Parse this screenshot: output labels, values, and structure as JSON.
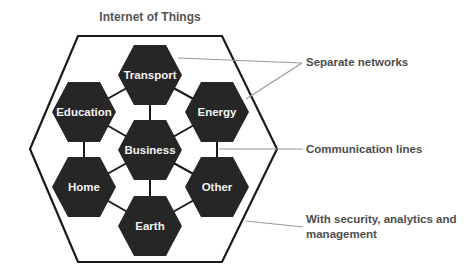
{
  "title": "Internet of Things",
  "colors": {
    "hex_fill": "#262626",
    "hex_text": "#f2f2f2",
    "outer_stroke": "#1a1a1a",
    "connector": "#1a1a1a",
    "leader": "#9a9a9a",
    "label_text": "#4d4d4d"
  },
  "center_node": {
    "label": "Business"
  },
  "nodes": [
    {
      "id": "transport",
      "label": "Transport"
    },
    {
      "id": "energy",
      "label": "Energy"
    },
    {
      "id": "other",
      "label": "Other"
    },
    {
      "id": "earth",
      "label": "Earth"
    },
    {
      "id": "home",
      "label": "Home"
    },
    {
      "id": "education",
      "label": "Education"
    }
  ],
  "annotations": [
    {
      "id": "separate-networks",
      "label": "Separate networks"
    },
    {
      "id": "communication-lines",
      "label": "Communication lines"
    },
    {
      "id": "security",
      "label_line1": "With security, analytics and",
      "label_line2": "management"
    }
  ]
}
